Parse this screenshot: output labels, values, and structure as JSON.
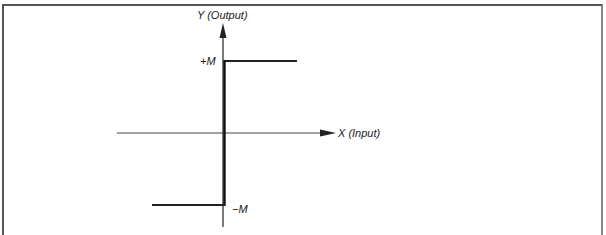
{
  "figure": {
    "type": "ideal-relay-characteristic",
    "y_axis_label": "Y (Output)",
    "x_axis_label": "X (Input)",
    "upper_level_label": "+M",
    "lower_level_label": "−M"
  },
  "geometry": {
    "origin": {
      "x": 223,
      "y": 133
    },
    "y_axis": {
      "x": 223,
      "top": 23,
      "bottom": 227
    },
    "x_axis": {
      "y": 133,
      "left": 117,
      "right": 336
    },
    "upper_level": {
      "y": 61,
      "x_start": 224,
      "x_end": 297
    },
    "lower_level": {
      "y": 205,
      "x_start": 152,
      "x_end": 224
    }
  },
  "colors": {
    "line": "#222222",
    "border": "#555555",
    "background": "#ffffff"
  }
}
